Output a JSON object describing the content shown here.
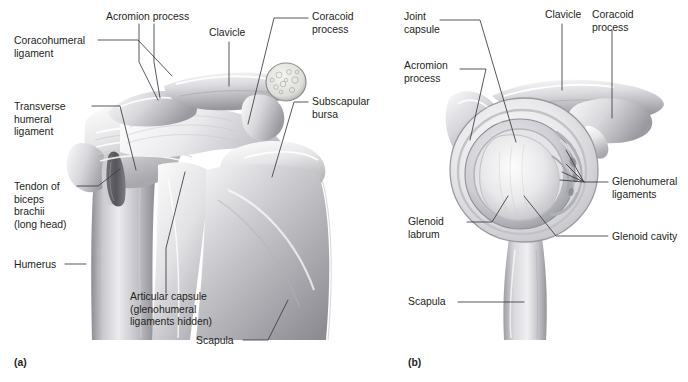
{
  "figure": {
    "background_color": "#ffffff",
    "text_color": "#231f20",
    "leader_line_color": "#3a3a3f"
  },
  "panels": [
    {
      "id": "a",
      "caption": "(a)",
      "description": "Anterior view of the right shoulder joint",
      "labels": [
        {
          "name": "coracohumeral-ligament",
          "lines": [
            "Coracohumeral",
            "ligament"
          ],
          "x": 14,
          "y": 40,
          "anchor": "start"
        },
        {
          "name": "acromion-process",
          "lines": [
            "Acromion process"
          ],
          "x": 106,
          "y": 16,
          "anchor": "start"
        },
        {
          "name": "clavicle",
          "lines": [
            "Clavicle"
          ],
          "x": 209,
          "y": 33,
          "anchor": "start"
        },
        {
          "name": "coracoid-process",
          "lines": [
            "Coracoid",
            "process"
          ],
          "x": 312,
          "y": 16,
          "anchor": "start"
        },
        {
          "name": "transverse-humeral-ligament",
          "lines": [
            "Transverse",
            "humeral",
            "ligament"
          ],
          "x": 14,
          "y": 106,
          "anchor": "start"
        },
        {
          "name": "subscapular-bursa",
          "lines": [
            "Subscapular",
            "bursa"
          ],
          "x": 312,
          "y": 100,
          "anchor": "start"
        },
        {
          "name": "tendon-of-biceps-brachii",
          "lines": [
            "Tendon of",
            "biceps",
            "brachii",
            "(long head)"
          ],
          "x": 14,
          "y": 183,
          "anchor": "start"
        },
        {
          "name": "humerus",
          "lines": [
            "Humerus"
          ],
          "x": 14,
          "y": 264,
          "anchor": "start"
        },
        {
          "name": "articular-capsule",
          "lines": [
            "Articular capsule",
            "(glenohumeral",
            "ligaments hidden)"
          ],
          "x": 130,
          "y": 296,
          "anchor": "start"
        },
        {
          "name": "scapula",
          "lines": [
            "Scapula"
          ],
          "x": 196,
          "y": 343,
          "anchor": "start"
        }
      ]
    },
    {
      "id": "b",
      "caption": "(b)",
      "description": "Lateral view of the glenoid cavity with the humerus removed",
      "labels": [
        {
          "name": "joint-capsule",
          "lines": [
            "Joint",
            "capsule"
          ],
          "x": 404,
          "y": 16,
          "anchor": "start"
        },
        {
          "name": "clavicle",
          "lines": [
            "Clavicle"
          ],
          "x": 545,
          "y": 14,
          "anchor": "start"
        },
        {
          "name": "coracoid-process",
          "lines": [
            "Coracoid",
            "process"
          ],
          "x": 592,
          "y": 14,
          "anchor": "start"
        },
        {
          "name": "acromion-process",
          "lines": [
            "Acromion",
            "process"
          ],
          "x": 404,
          "y": 65,
          "anchor": "start"
        },
        {
          "name": "glenohumeral-ligaments",
          "lines": [
            "Glenohumeral",
            "ligaments"
          ],
          "x": 612,
          "y": 180,
          "anchor": "start"
        },
        {
          "name": "glenoid-labrum",
          "lines": [
            "Glenoid",
            "labrum"
          ],
          "x": 408,
          "y": 221,
          "anchor": "start"
        },
        {
          "name": "glenoid-cavity",
          "lines": [
            "Glenoid cavity"
          ],
          "x": 612,
          "y": 235,
          "anchor": "start"
        },
        {
          "name": "scapula",
          "lines": [
            "Scapula"
          ],
          "x": 408,
          "y": 300,
          "anchor": "start"
        }
      ]
    }
  ],
  "captions": {
    "panel_a": "(a)",
    "panel_b": "(b)"
  }
}
